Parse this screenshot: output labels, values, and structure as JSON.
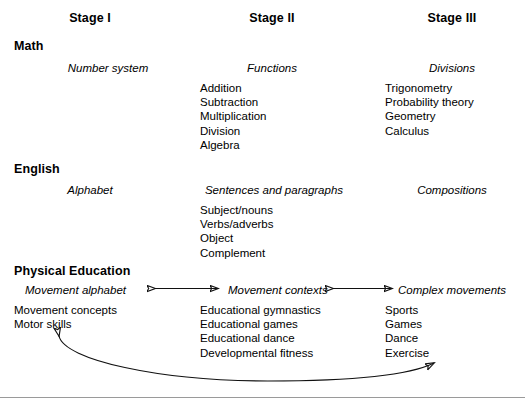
{
  "columns": {
    "headers": [
      {
        "label": "Stage I",
        "cx": 90
      },
      {
        "label": "Stage II",
        "cx": 272
      },
      {
        "label": "Stage III",
        "cx": 452
      }
    ]
  },
  "sections": [
    {
      "name": "math",
      "heading": "Math",
      "stages": [
        {
          "title": "Number system",
          "items": []
        },
        {
          "title": "Functions",
          "items": [
            "Addition",
            "Subtraction",
            "Multiplication",
            "Division",
            "Algebra"
          ]
        },
        {
          "title": "Divisions",
          "items": [
            "Trigonometry",
            "Probability theory",
            "Geometry",
            "Calculus"
          ]
        }
      ]
    },
    {
      "name": "english",
      "heading": "English",
      "stages": [
        {
          "title": "Alphabet",
          "items": []
        },
        {
          "title": "Sentences and paragraphs",
          "items": [
            "Subject/nouns",
            "Verbs/adverbs",
            "Object",
            "Complement"
          ]
        },
        {
          "title": "Compositions",
          "items": []
        }
      ]
    },
    {
      "name": "physical-education",
      "heading": "Physical Education",
      "stages": [
        {
          "title": "Movement alphabet",
          "items": [
            "Movement concepts",
            "Motor skills"
          ]
        },
        {
          "title": "Movement contexts",
          "items": [
            "Educational gymnastics",
            "Educational games",
            "Educational dance",
            "Developmental fitness"
          ]
        },
        {
          "title": "Complex movements",
          "items": [
            "Sports",
            "Games",
            "Dance",
            "Exercise"
          ]
        }
      ]
    }
  ],
  "connectors": [
    {
      "name": "arrow-stage1-stage2",
      "kind": "double-headed-straight"
    },
    {
      "name": "arrow-stage2-stage3",
      "kind": "double-headed-straight"
    },
    {
      "name": "arrow-stage3-stage1-feedback",
      "kind": "double-headed-curved"
    }
  ],
  "colors": {
    "text": "#000000",
    "stroke": "#111111",
    "rule": "#9a9a9a",
    "background": "#ffffff"
  }
}
